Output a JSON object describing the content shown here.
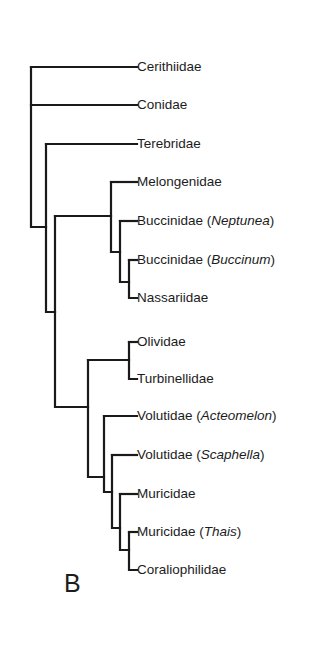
{
  "figure": {
    "panel_label": "B",
    "type": "cladogram",
    "line_color": "#1a1a1a",
    "text_color": "#1c1c1c"
  },
  "taxa": [
    {
      "id": "cerithiidae",
      "family": "Cerithiidae",
      "genus": "",
      "y": 67
    },
    {
      "id": "conidae",
      "family": "Conidae",
      "genus": "",
      "y": 105
    },
    {
      "id": "terebridae",
      "family": "Terebridae",
      "genus": "",
      "y": 144
    },
    {
      "id": "melongenidae",
      "family": "Melongenidae",
      "genus": "",
      "y": 182
    },
    {
      "id": "buccinidae-neptunea",
      "family": "Buccinidae",
      "genus": "Neptunea",
      "y": 221
    },
    {
      "id": "buccinidae-buccinum",
      "family": "Buccinidae",
      "genus": "Buccinum",
      "y": 260
    },
    {
      "id": "nassariidae",
      "family": "Nassariidae",
      "genus": "",
      "y": 298
    },
    {
      "id": "olividae",
      "family": "Olividae",
      "genus": "",
      "y": 342
    },
    {
      "id": "turbinellidae",
      "family": "Turbinellidae",
      "genus": "",
      "y": 379
    },
    {
      "id": "volutidae-acteomelon",
      "family": "Volutidae",
      "genus": "Acteomelon",
      "y": 416
    },
    {
      "id": "volutidae-scaphella",
      "family": "Volutidae",
      "genus": "Scaphella",
      "y": 455
    },
    {
      "id": "muricidae",
      "family": "Muricidae",
      "genus": "",
      "y": 494
    },
    {
      "id": "muricidae-thais",
      "family": "Muricidae",
      "genus": "Thais",
      "y": 532
    },
    {
      "id": "coraliophilidae",
      "family": "Coraliophilidae",
      "genus": "",
      "y": 570
    }
  ],
  "leaf_x": 137,
  "tree_segments": [
    "M31 67 H137",
    "M31 105 H137",
    "M31 67 V227 H46",
    "M46 144 H137",
    "M46 144 V312 H55",
    "M55 216 H111",
    "M111 182 H137",
    "M111 182 V252 H120",
    "M120 221 H137",
    "M120 221 V282 H129",
    "M129 260 H137",
    "M129 260 V298 H137",
    "M55 216 V407 H88",
    "M88 360 H129",
    "M129 342 H137",
    "M129 342 V379 H137",
    "M88 360 V477 H104",
    "M104 416 H137",
    "M104 416 V492 H112",
    "M112 455 H137",
    "M112 455 V528 H120",
    "M120 494 H137",
    "M120 494 V550 H129",
    "M129 532 H137",
    "M129 532 V570 H137"
  ]
}
